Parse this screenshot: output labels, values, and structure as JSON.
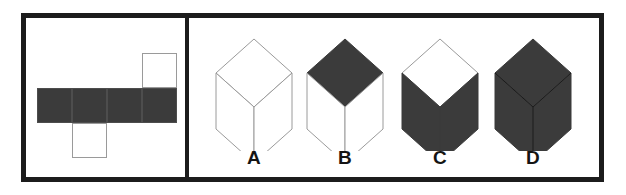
{
  "figure": {
    "kind": "spatial-reasoning-cube-folding-item",
    "colors": {
      "frame": "#1c1c1c",
      "shaded_face": "#3b3b3b",
      "blank_face": "#ffffff",
      "thin_outline": "#9a9a9a",
      "label_text": "#141414",
      "background": "#ffffff"
    }
  },
  "net_panel": {
    "name": "unfolded-cube-net",
    "cell_size": 35,
    "cells": [
      {
        "id": "row-1",
        "x": 16,
        "y": 41,
        "fill": "shaded"
      },
      {
        "id": "row-2",
        "x": 51,
        "y": 41,
        "fill": "shaded"
      },
      {
        "id": "row-3",
        "x": 86,
        "y": 41,
        "fill": "shaded"
      },
      {
        "id": "row-4",
        "x": 121,
        "y": 41,
        "fill": "shaded"
      },
      {
        "id": "top-flap",
        "x": 121,
        "y": 6,
        "fill": "blank"
      },
      {
        "id": "bottom-flap",
        "x": 51,
        "y": 76,
        "fill": "blank"
      }
    ],
    "shaded_count": 4,
    "blank_count": 2
  },
  "options_panel": {
    "name": "answer-options",
    "options": [
      {
        "label": "A",
        "center_x": 65,
        "faces": {
          "top": "blank",
          "left": "blank",
          "right": "blank"
        }
      },
      {
        "label": "B",
        "center_x": 156,
        "faces": {
          "top": "shaded",
          "left": "blank",
          "right": "blank"
        }
      },
      {
        "label": "C",
        "center_x": 251,
        "faces": {
          "top": "blank",
          "left": "shaded",
          "right": "shaded"
        }
      },
      {
        "label": "D",
        "center_x": 344,
        "faces": {
          "top": "shaded",
          "left": "shaded",
          "right": "shaded"
        }
      }
    ]
  }
}
